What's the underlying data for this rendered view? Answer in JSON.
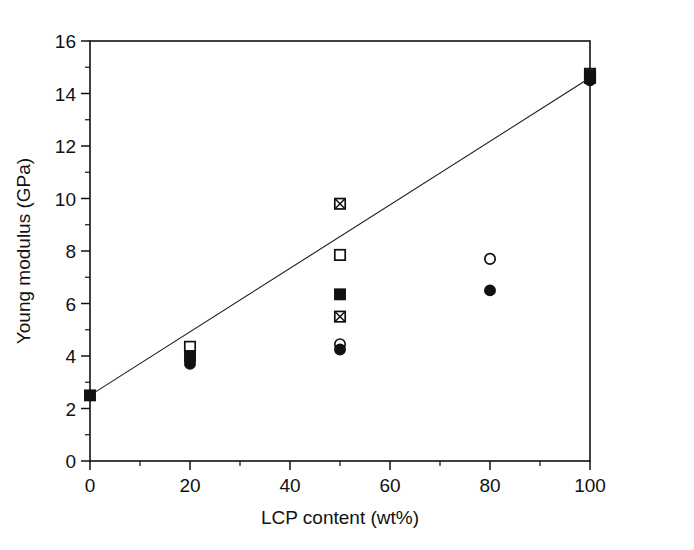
{
  "chart_data": {
    "type": "scatter",
    "title": "",
    "xlabel": "LCP content (wt%)",
    "ylabel": "Young modulus (GPa)",
    "xlim": [
      0,
      100
    ],
    "ylim": [
      0,
      16
    ],
    "xticks": [
      0,
      20,
      40,
      60,
      80,
      100
    ],
    "yticks": [
      0,
      2,
      4,
      6,
      8,
      10,
      12,
      14,
      16
    ],
    "xtick_labels": [
      "0",
      "20",
      "40",
      "60",
      "80",
      "100"
    ],
    "ytick_labels": [
      "0",
      "2",
      "4",
      "6",
      "8",
      "10",
      "12",
      "14",
      "16"
    ],
    "x_minor_interval": 10,
    "y_minor_interval": 1,
    "grid": false,
    "legend": false,
    "legend_position": "none",
    "frame": "box",
    "series": [
      {
        "name": "filled-square",
        "marker": "filled-square",
        "x": [
          0,
          20,
          50,
          100
        ],
        "y": [
          2.5,
          4.0,
          6.35,
          14.7
        ]
      },
      {
        "name": "open-square",
        "marker": "open-square",
        "x": [
          20,
          50,
          100
        ],
        "y": [
          4.35,
          7.85,
          14.75
        ]
      },
      {
        "name": "crossed-square",
        "marker": "crossed-square",
        "x": [
          50,
          50,
          100
        ],
        "y": [
          9.8,
          5.5,
          14.6
        ]
      },
      {
        "name": "open-circle",
        "marker": "open-circle",
        "x": [
          20,
          50,
          80,
          100
        ],
        "y": [
          3.85,
          4.45,
          7.7,
          14.6
        ]
      },
      {
        "name": "filled-circle",
        "marker": "filled-circle",
        "x": [
          20,
          50,
          80,
          100
        ],
        "y": [
          3.7,
          4.25,
          6.5,
          14.5
        ]
      }
    ],
    "trend_line": {
      "name": "rule-of-mixtures-line",
      "x": [
        0,
        100
      ],
      "y": [
        2.5,
        14.6
      ]
    }
  }
}
